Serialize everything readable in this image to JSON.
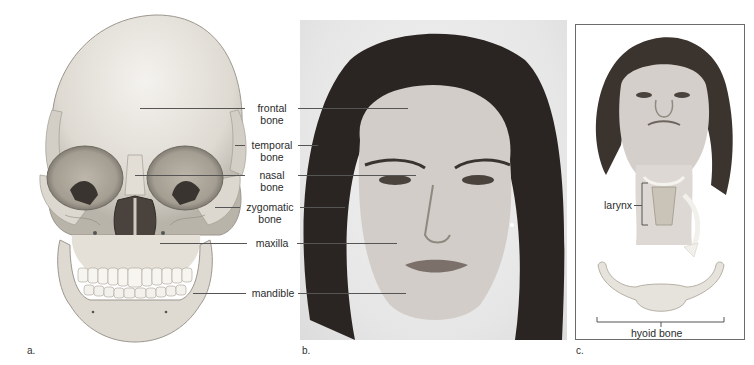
{
  "figure": {
    "panels": [
      {
        "id": "a",
        "label": "a.",
        "content": "anterior view of skull illustration"
      },
      {
        "id": "b",
        "label": "b.",
        "content": "photograph of woman's face, frontal view"
      },
      {
        "id": "c",
        "label": "c.",
        "content": "woman looking up with larynx and hyoid bone illustration"
      }
    ],
    "center_labels": [
      {
        "line1": "frontal",
        "line2": "bone"
      },
      {
        "line1": "temporal",
        "line2": "bone"
      },
      {
        "line1": "nasal",
        "line2": "bone"
      },
      {
        "line1": "zygomatic",
        "line2": "bone"
      },
      {
        "line1": "maxilla",
        "line2": ""
      },
      {
        "line1": "mandible",
        "line2": ""
      }
    ],
    "panel_c_labels": {
      "larynx": "larynx",
      "hyoid": "hyoid bone"
    },
    "colors": {
      "bone": "#e9e6df",
      "bone_shadow": "#bdb8ae",
      "orbit_dark": "#3a3430",
      "leader_line": "#555555",
      "frame": "#6b6b6b",
      "hair": "#2a2522",
      "skin": "#cfcac6"
    }
  }
}
